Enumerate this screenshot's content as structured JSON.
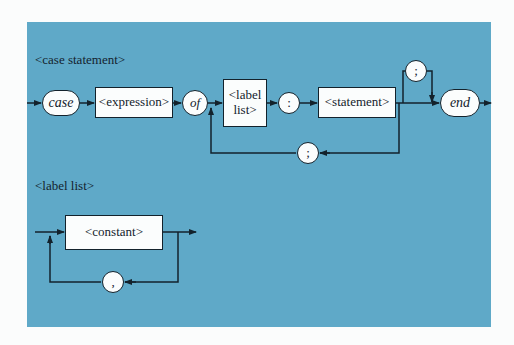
{
  "colors": {
    "panel": "#5fa9c8",
    "line": "#13222c",
    "node_fill": "#fbfdfd",
    "page": "#fbfcfc"
  },
  "case_statement": {
    "title": "<case statement>",
    "nodes": {
      "case": "case",
      "expression": "<expression>",
      "of": "of",
      "label_list_line1": "<label",
      "label_list_line2": "list>",
      "colon": ":",
      "statement": "<statement>",
      "loop_semicolon": ";",
      "optional_semicolon": ";",
      "end": "end"
    }
  },
  "label_list": {
    "title": "<label list>",
    "nodes": {
      "constant": "<constant>",
      "comma": ","
    }
  }
}
